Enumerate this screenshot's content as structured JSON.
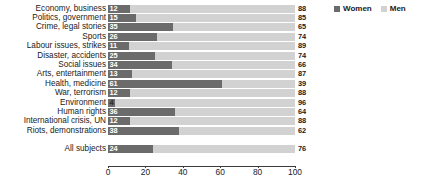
{
  "legend": {
    "position": "top-right",
    "entries": [
      {
        "label": "Women",
        "color": "#6b6b6b",
        "icon": "square-swatch-icon"
      },
      {
        "label": "Men",
        "color": "#d2d2d2",
        "icon": "square-swatch-icon"
      }
    ]
  },
  "chart_data": {
    "type": "bar",
    "orientation": "horizontal",
    "stacked": true,
    "stacked_total": 100,
    "title": "",
    "subtitle": "",
    "xlabel": "",
    "ylabel": "",
    "xlim": [
      0,
      100
    ],
    "xticks": [
      0,
      20,
      40,
      60,
      80,
      100
    ],
    "xtick_labels": [
      "0",
      "20",
      "40",
      "60",
      "80",
      "100"
    ],
    "grid": false,
    "categories": [
      "Economy, business",
      "Politics, government",
      "Crime, legal stories",
      "Sports",
      "Labour issues, strikes",
      "Disaster, accidents",
      "Social issues",
      "Arts, entertainment",
      "Health, medicine",
      "War, terrorism",
      "Environment",
      "Human rights",
      "International crisis, UN",
      "Riots, demonstrations"
    ],
    "summary_category": "All subjects",
    "series": [
      {
        "name": "Women",
        "color": "#6b6b6b",
        "values": [
          12,
          15,
          35,
          26,
          11,
          25,
          34,
          13,
          61,
          12,
          4,
          36,
          12,
          38
        ],
        "summary_value": 24
      },
      {
        "name": "Men",
        "color": "#d2d2d2",
        "values": [
          88,
          85,
          65,
          74,
          89,
          74,
          66,
          87,
          39,
          88,
          96,
          64,
          88,
          62
        ],
        "summary_value": 76
      }
    ]
  }
}
